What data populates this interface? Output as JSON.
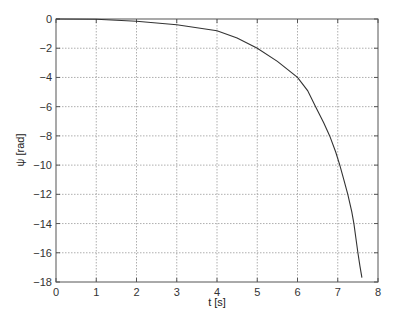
{
  "chart_data": {
    "type": "line",
    "title": "",
    "xlabel": "t [s]",
    "ylabel": "ψ [rad]",
    "xlim": [
      0,
      8
    ],
    "ylim": [
      -18,
      0
    ],
    "grid": true,
    "legend": null,
    "x_ticks": [
      "0",
      "1",
      "2",
      "3",
      "4",
      "5",
      "6",
      "7",
      "8"
    ],
    "y_ticks": [
      "0",
      "−2",
      "−4",
      "−6",
      "−8",
      "−10",
      "−12",
      "−14",
      "−16",
      "−18"
    ],
    "series": [
      {
        "name": "psi",
        "x": [
          0,
          1,
          2,
          3,
          4,
          4.5,
          5,
          5.5,
          6,
          6.25,
          6.45,
          6.65,
          6.8,
          6.95,
          7.05,
          7.15,
          7.25,
          7.35,
          7.4,
          7.45,
          7.5,
          7.55,
          7.6
        ],
        "y": [
          0,
          -0.02,
          -0.15,
          -0.4,
          -0.8,
          -1.3,
          -2.0,
          -2.9,
          -4.0,
          -4.9,
          -6.0,
          -7.1,
          -8.0,
          -9.1,
          -10.0,
          -11.0,
          -12.0,
          -13.2,
          -14.0,
          -15.0,
          -16.0,
          -16.9,
          -17.7
        ]
      }
    ]
  }
}
